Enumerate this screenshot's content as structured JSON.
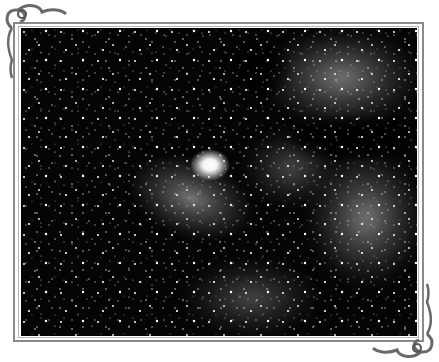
{
  "image": {
    "subject": "comet against a dense star field",
    "frame_color": "#8a8a8a",
    "background_color": "#ffffff",
    "photo_colors": {
      "sky": "#050505",
      "comet_core": "#ffffff",
      "milky_way": "#9a9a9a"
    }
  },
  "ornaments": [
    {
      "position": "top-left",
      "icon": "scroll-flourish-icon"
    },
    {
      "position": "bottom-right",
      "icon": "scroll-flourish-icon"
    }
  ]
}
